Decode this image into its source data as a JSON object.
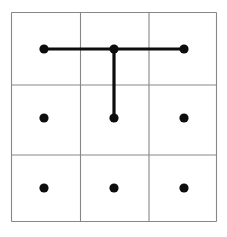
{
  "figure": {
    "name": "nine-dot-grid-with-connector-lines",
    "width": 227,
    "height": 237,
    "background_color": "#ffffff"
  },
  "grid": {
    "rows": 3,
    "columns": 3,
    "line_color": "#878787",
    "line_width": 1.1,
    "x_lines": [
      11.5,
      80.5,
      149.0,
      216.5
    ],
    "y_lines": [
      12.5,
      85.0,
      155.0,
      221.5
    ]
  },
  "dots": {
    "color": "#0d0d0d",
    "radius": 4.6,
    "items": [
      {
        "id": "dot-r1c1",
        "row": 1,
        "column": 1,
        "cx": 44,
        "cy": 49
      },
      {
        "id": "dot-r1c2",
        "row": 1,
        "column": 2,
        "cx": 114,
        "cy": 49
      },
      {
        "id": "dot-r1c3",
        "row": 1,
        "column": 3,
        "cx": 184,
        "cy": 49
      },
      {
        "id": "dot-r2c1",
        "row": 2,
        "column": 1,
        "cx": 44,
        "cy": 118
      },
      {
        "id": "dot-r2c2",
        "row": 2,
        "column": 2,
        "cx": 114,
        "cy": 118
      },
      {
        "id": "dot-r2c3",
        "row": 2,
        "column": 3,
        "cx": 184,
        "cy": 118
      },
      {
        "id": "dot-r3c1",
        "row": 3,
        "column": 1,
        "cx": 44,
        "cy": 188
      },
      {
        "id": "dot-r3c2",
        "row": 3,
        "column": 2,
        "cx": 114,
        "cy": 188
      },
      {
        "id": "dot-r3c3",
        "row": 3,
        "column": 3,
        "cx": 184,
        "cy": 188
      }
    ]
  },
  "connectors": {
    "color": "#0d0d0d",
    "line_width": 3.2,
    "items": [
      {
        "id": "connector-horizontal-top-row",
        "orientation": "horizontal",
        "from": "dot-r1c1",
        "to": "dot-r1c3",
        "x1": 44,
        "y1": 49,
        "x2": 184,
        "y2": 49
      },
      {
        "id": "connector-vertical-center",
        "orientation": "vertical",
        "from": "dot-r1c2",
        "to": "dot-r2c2",
        "x1": 114,
        "y1": 49,
        "x2": 114,
        "y2": 118
      }
    ]
  }
}
